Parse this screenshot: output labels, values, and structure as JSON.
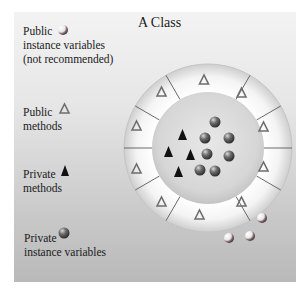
{
  "diagram": {
    "title": "A Class",
    "legend": [
      {
        "key": "public_vars",
        "lines": [
          "Public",
          "instance variables",
          "(not recommended)"
        ],
        "icon": "sphere-icon",
        "icon_style": "light"
      },
      {
        "key": "public_methods",
        "lines": [
          "Public",
          "methods"
        ],
        "icon": "hollow-triangle-icon"
      },
      {
        "key": "private_methods",
        "lines": [
          "Private",
          "methods"
        ],
        "icon": "solid-triangle-icon"
      },
      {
        "key": "private_vars",
        "lines": [
          "Private",
          "instance variables"
        ],
        "icon": "sphere-icon",
        "icon_style": "dark"
      }
    ],
    "ring": {
      "segments": 12,
      "public_method_count": 12,
      "private_method_count": 4,
      "private_variable_count": 7,
      "escaped_public_variable_count": 3
    },
    "colors": {
      "background_top": "#f3f3f3",
      "background_bottom": "#b9b9b9",
      "ring_fill": "#f7f7f7",
      "inner_fill": "#dcdcdc",
      "triangle_stroke": "#6e6e6e",
      "solid_triangle": "#111111",
      "sphere_dark": "#555555"
    }
  }
}
